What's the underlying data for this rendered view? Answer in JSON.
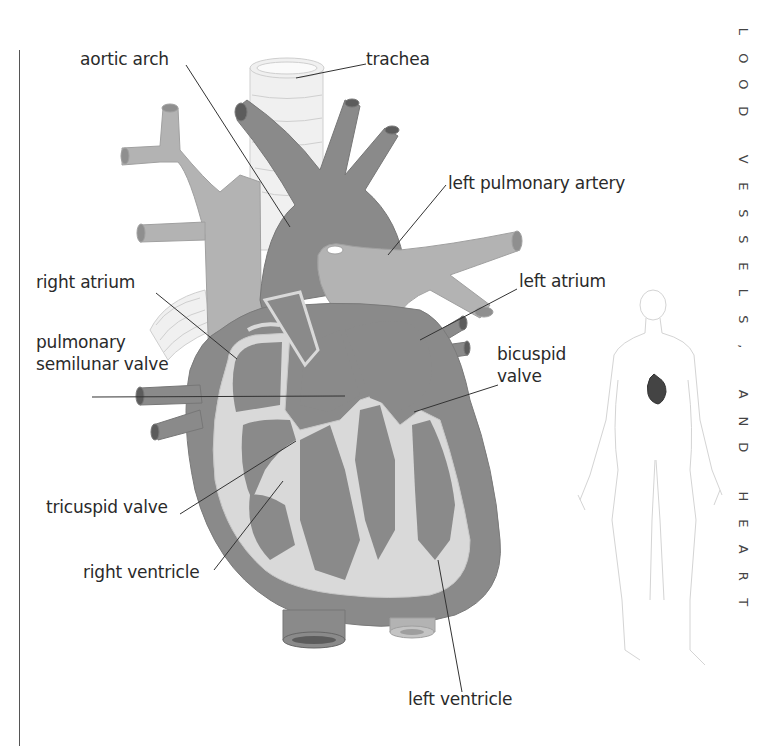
{
  "side_title": {
    "text": "LOOD VESSELS, AND HEART",
    "letters": [
      "L",
      "O",
      "O",
      "D",
      "",
      "V",
      "E",
      "S",
      "S",
      "E",
      "L",
      "S",
      ",",
      "",
      "A",
      "N",
      "D",
      "",
      "H",
      "E",
      "A",
      "R",
      "T"
    ]
  },
  "labels": {
    "aortic_arch": "aortic arch",
    "trachea": "trachea",
    "left_pulmonary_artery": "left pulmonary artery",
    "right_atrium": "right atrium",
    "left_atrium": "left atrium",
    "pulmonary_semilunar_valve_line1": "pulmonary",
    "pulmonary_semilunar_valve_line2": "semilunar valve",
    "bicuspid_valve_line1": "bicuspid",
    "bicuspid_valve_line2": "valve",
    "tricuspid_valve": "tricuspid valve",
    "right_ventricle": "right ventricle",
    "left_ventricle": "left ventricle"
  },
  "colors": {
    "heart_dark": "#8a8a8a",
    "vessel_light": "#b3b3b3",
    "lining": "#d9d9d9",
    "trachea": "#efefef",
    "leader_line": "#333333"
  },
  "inset": {
    "description": "human body outline with heart location highlighted"
  }
}
